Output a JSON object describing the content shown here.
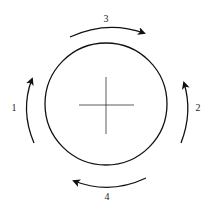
{
  "diagram": {
    "colors": {
      "stroke": "#111111",
      "background": "#ffffff"
    },
    "circle": {
      "cx": 106,
      "cy": 104,
      "r": 61
    },
    "crosshair": {
      "cx": 106,
      "cy": 105
    },
    "arrows": [
      {
        "id": 1,
        "label": "1",
        "position": "left",
        "direction": "up"
      },
      {
        "id": 2,
        "label": "2",
        "position": "right",
        "direction": "up"
      },
      {
        "id": 3,
        "label": "3",
        "position": "top",
        "direction": "right"
      },
      {
        "id": 4,
        "label": "4",
        "position": "bottom",
        "direction": "left"
      }
    ]
  }
}
